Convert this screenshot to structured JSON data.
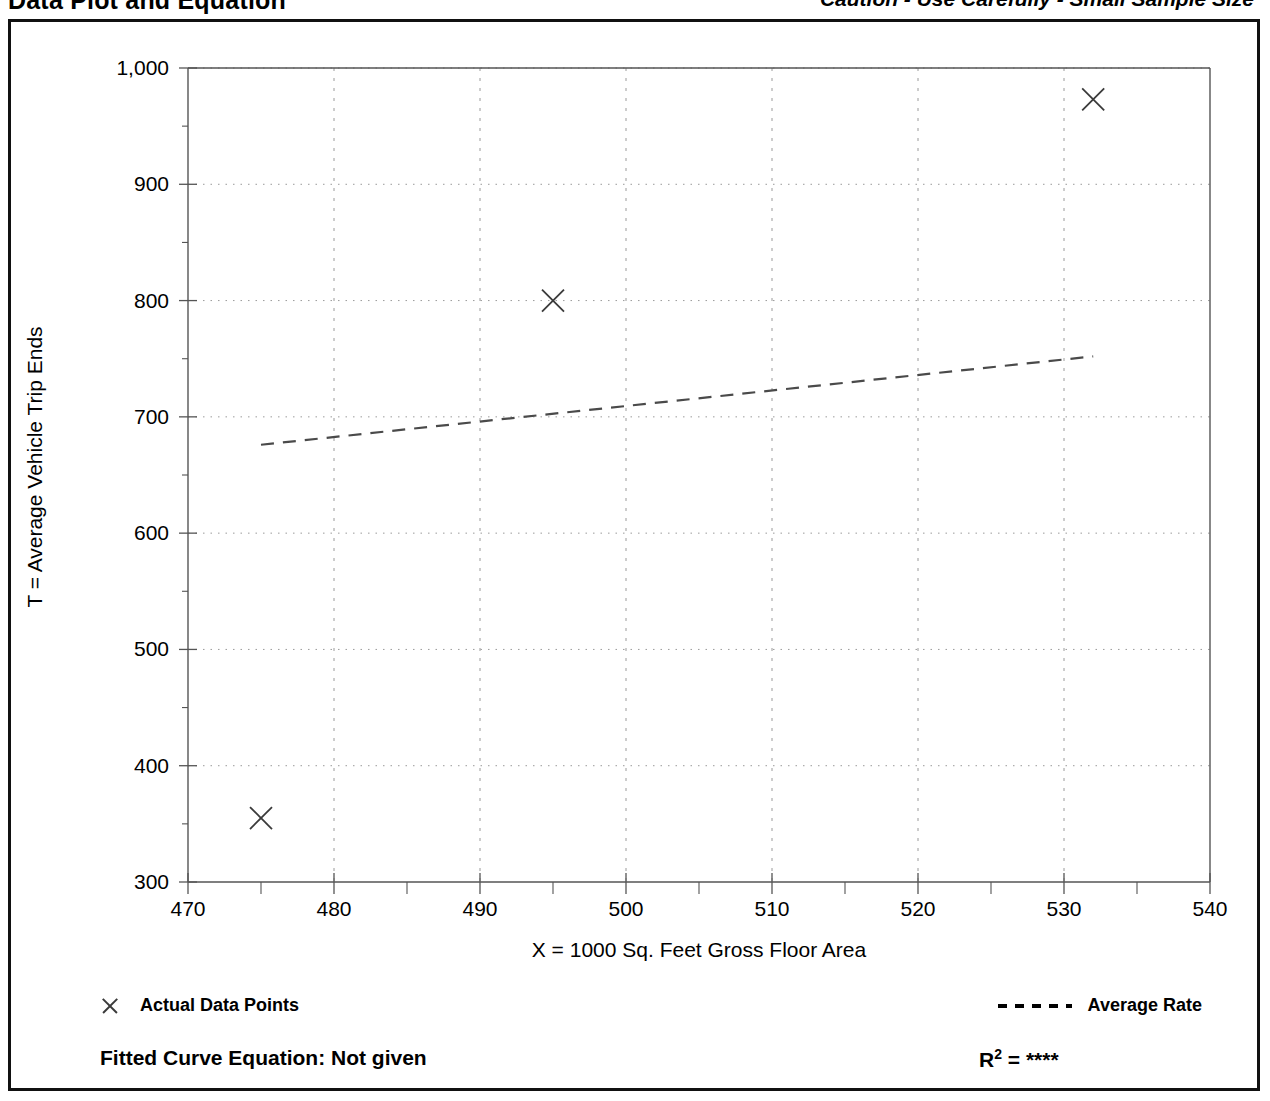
{
  "header": {
    "title": "Data Plot and Equation",
    "caution": "Caution - Use Carefully - Small Sample Size"
  },
  "legend": {
    "data_points_label": "Actual Data Points",
    "data_points_icon": "x-marker-icon",
    "average_rate_label": "Average Rate",
    "average_rate_icon": "dashed-line-icon"
  },
  "footer": {
    "fitted_curve_equation": "Fitted Curve Equation:  Not given",
    "r_squared": "R",
    "r_squared_exponent": "2",
    "r_squared_value": " = ****"
  },
  "colors": {
    "frame": "#111111",
    "axis": "#555555",
    "grid": "#9a9a9a",
    "marker": "#3a3a3a",
    "trend": "#4a4a4a"
  },
  "chart_data": {
    "type": "scatter",
    "title": "Data Plot and Equation",
    "subtitle": "Caution - Use Carefully - Small Sample Size",
    "xlabel": "X = 1000 Sq. Feet Gross Floor Area",
    "ylabel": "T = Average Vehicle Trip Ends",
    "xlim": [
      470,
      540
    ],
    "ylim": [
      300,
      1000
    ],
    "xticks": [
      470,
      480,
      490,
      500,
      510,
      520,
      530,
      540
    ],
    "xtick_labels": [
      "470",
      "480",
      "490",
      "500",
      "510",
      "520",
      "530",
      "540"
    ],
    "yticks": [
      300,
      400,
      500,
      600,
      700,
      800,
      900,
      1000
    ],
    "ytick_labels": [
      "300",
      "400",
      "500",
      "600",
      "700",
      "800",
      "900",
      "1,000"
    ],
    "y_minor_ticks": [
      350,
      450,
      550,
      650,
      750,
      850,
      950
    ],
    "x_minor_ticks": [
      475,
      485,
      495,
      505,
      515,
      525,
      535
    ],
    "grid": true,
    "grid_style": "dotted",
    "legend_position": "below-plot",
    "series": [
      {
        "name": "Actual Data Points",
        "marker": "x",
        "points": [
          {
            "x": 475,
            "y": 355
          },
          {
            "x": 495,
            "y": 800
          },
          {
            "x": 532,
            "y": 973
          }
        ]
      },
      {
        "name": "Average Rate",
        "style": "dashed-line",
        "line": {
          "x_start": 475,
          "y_start": 676,
          "x_end": 532,
          "y_end": 752
        }
      }
    ],
    "fitted_curve_equation": "Not given",
    "r_squared": "****"
  }
}
